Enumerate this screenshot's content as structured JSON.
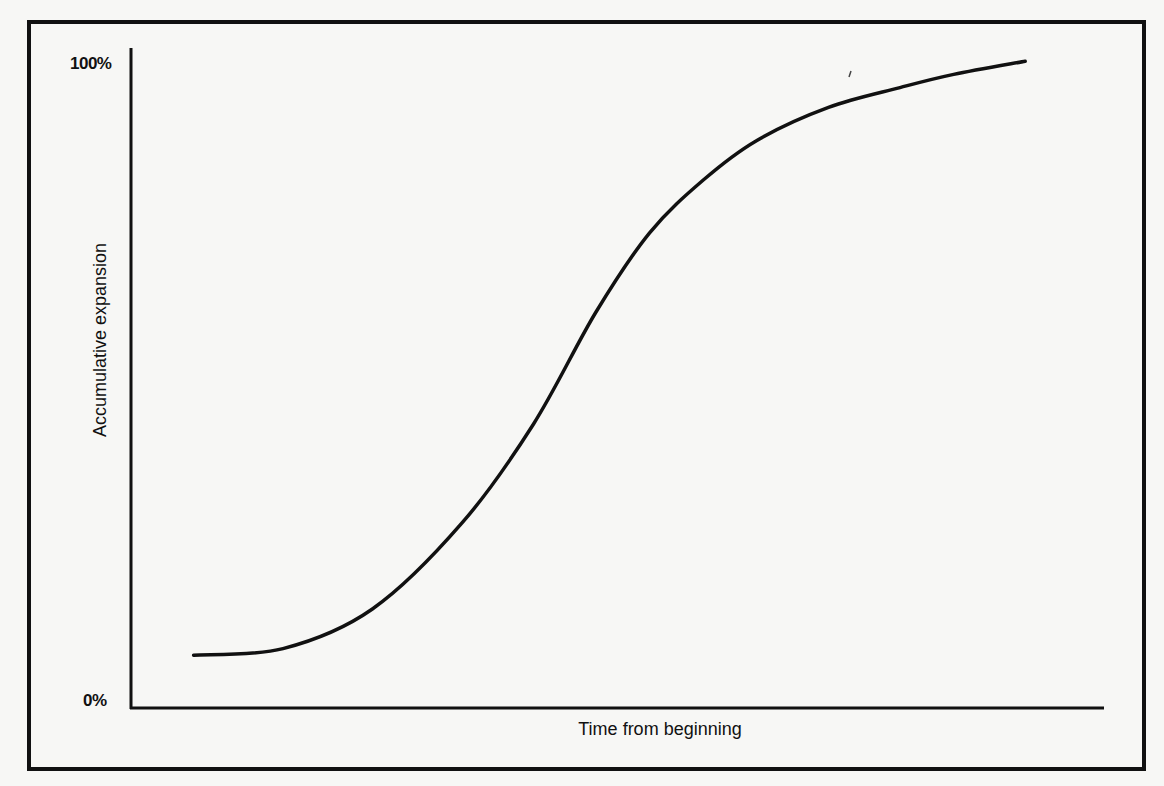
{
  "chart_data": {
    "type": "line",
    "title": "",
    "xlabel": "Time from beginning",
    "ylabel": "Accumulative expansion",
    "y_ticks": [
      "0%",
      "100%"
    ],
    "x_ticks": [],
    "ylim": [
      0,
      100
    ],
    "xlim": [
      0,
      100
    ],
    "grid": false,
    "legend": null,
    "series": [
      {
        "name": "Accumulative expansion (S-curve)",
        "x": [
          7,
          17,
          27,
          37,
          45,
          52,
          58,
          64,
          70,
          78,
          86,
          92,
          100
        ],
        "values": [
          8,
          9,
          15,
          28,
          43,
          60,
          72,
          80,
          86,
          91,
          94,
          96,
          98
        ]
      }
    ]
  },
  "labels": {
    "y_max": "100%",
    "y_min": "0%",
    "y_axis_title": "Accumulative expansion",
    "x_axis_title": "Time from beginning"
  },
  "colors": {
    "ink": "#111111",
    "paper": "#f7f7f5"
  }
}
